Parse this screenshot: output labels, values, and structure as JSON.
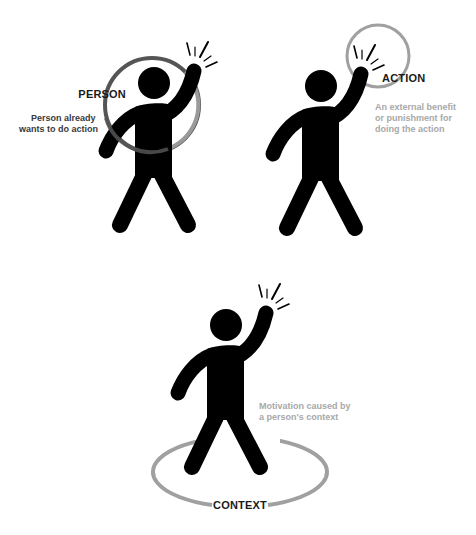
{
  "panels": {
    "person": {
      "label": "PERSON",
      "note_lines": [
        "Person already",
        "wants to do action"
      ],
      "ring_color_dark": "#555555",
      "ring_color_light": "#9a9a9a",
      "note_color": "#3a3a3a"
    },
    "action": {
      "label": "ACTION",
      "note_lines": [
        "An external benefit",
        "or punishment for",
        "doing the action"
      ],
      "ring_color": "#a0a0a0",
      "note_color": "#a8a8a8"
    },
    "context": {
      "label": "CONTEXT",
      "note_lines": [
        "Motivation caused by",
        "a person's context"
      ],
      "ring_color": "#a0a0a0",
      "note_color": "#a8a8a8"
    }
  },
  "figure": {
    "icon": "raised-hand-person-icon",
    "color": "#000000"
  }
}
